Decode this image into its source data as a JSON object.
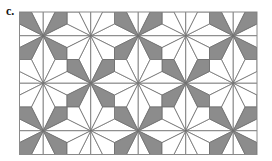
{
  "panel_label": "c.",
  "tiling": {
    "frame": {
      "x": 19.5,
      "y": 12,
      "width": 237.5,
      "height": 142.5
    },
    "cell_size": 47.5,
    "origin": {
      "x": 43.25,
      "y": 35.75
    },
    "star_colors": [
      [
        "gray",
        "white",
        "gray",
        "white",
        "gray"
      ],
      [
        "white",
        "gray",
        "white",
        "gray",
        "white"
      ],
      [
        "gray",
        "white",
        "gray",
        "white",
        "gray"
      ]
    ],
    "colors": {
      "gray": "#8c8c8c",
      "white": "#ffffff",
      "line": "#6e6e6e",
      "border": "#8a8a8a"
    }
  }
}
